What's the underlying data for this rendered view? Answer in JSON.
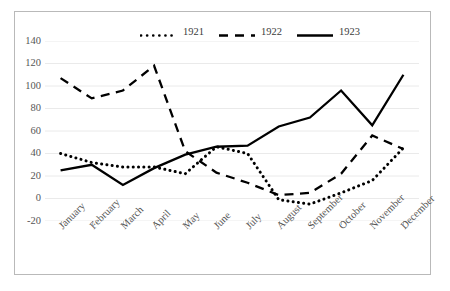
{
  "chart_data": {
    "type": "line",
    "title": "",
    "subtitle": "",
    "xlabel": "",
    "ylabel": "",
    "categories": [
      "January",
      "February",
      "March",
      "April",
      "May",
      "June",
      "July",
      "August",
      "September",
      "October",
      "November",
      "December"
    ],
    "series": [
      {
        "name": "1921",
        "style": "dotted",
        "color": "#000000",
        "values": [
          40,
          32,
          28,
          28,
          22,
          46,
          40,
          -1,
          -5,
          5,
          16,
          45
        ]
      },
      {
        "name": "1922",
        "style": "dashed",
        "color": "#000000",
        "values": [
          107,
          89,
          96,
          118,
          42,
          23,
          14,
          3,
          5,
          22,
          56,
          44
        ]
      },
      {
        "name": "1923",
        "style": "solid",
        "color": "#000000",
        "values": [
          25,
          30,
          12,
          27,
          39,
          46,
          47,
          64,
          72,
          96,
          65,
          110
        ]
      }
    ],
    "ylim": [
      -20,
      140
    ],
    "ytick_labels": [
      "140",
      "120",
      "100",
      "80",
      "60",
      "40",
      "20",
      "0",
      "-20"
    ],
    "ytick_values": [
      140,
      120,
      100,
      80,
      60,
      40,
      20,
      0,
      -20
    ],
    "grid": true,
    "grid_axis": "y",
    "legend_position": "top-center",
    "legend_entries": [
      "1921",
      "1922",
      "1923"
    ],
    "frame_color": "#b9b9b9",
    "grid_color": "#eaeaea",
    "tick_label_color": "#565656"
  }
}
